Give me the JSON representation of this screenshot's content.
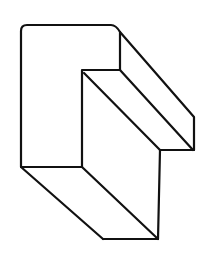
{
  "figure": {
    "stroke_color": "#111111",
    "background_color": "#ffffff"
  }
}
